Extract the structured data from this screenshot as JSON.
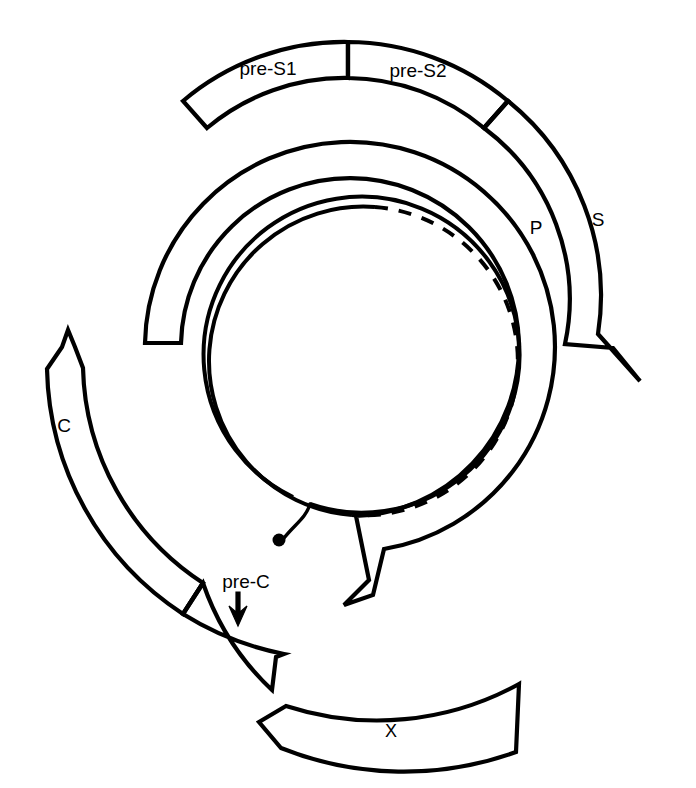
{
  "figure": {
    "background_color": "#ffffff",
    "stroke_color": "#000000",
    "width": 696,
    "height": 788
  },
  "genome": {
    "center": {
      "x": 350,
      "y": 347
    },
    "strands": {
      "outer_strand": {
        "name": "minus-strand-dna",
        "style": "solid",
        "radius": 158,
        "description": "complete circular strand with nick"
      },
      "inner_strand": {
        "name": "plus-strand-dna",
        "style": "solid-then-dashed",
        "radius": 142,
        "description": "incomplete strand, dashed where missing"
      },
      "protein_label": "terminal-protein-dot"
    }
  },
  "orfs": [
    {
      "id": "pre-s1",
      "label": "pre-S1",
      "label_x": 268,
      "label_y": 70,
      "radius": 248,
      "band_width": 36,
      "start_deg": 228,
      "end_deg": 268,
      "start_cap": "blunt",
      "end_cap": "none"
    },
    {
      "id": "pre-s2",
      "label": "pre-S2",
      "label_x": 418,
      "label_y": 72,
      "radius": 248,
      "band_width": 36,
      "start_deg": 268,
      "end_deg": 297,
      "start_cap": "none",
      "end_cap": "none"
    },
    {
      "id": "s",
      "label": "S",
      "label_x": 598,
      "label_y": 221,
      "radius": 248,
      "band_width": 36,
      "start_deg": 297,
      "end_deg": 372,
      "start_cap": "none",
      "end_cap": "arrow"
    },
    {
      "id": "p",
      "label": "P",
      "label_x": 536,
      "label_y": 229,
      "radius": 205,
      "band_width": 36,
      "start_deg": 180,
      "end_deg": 412,
      "start_cap": "blunt",
      "end_cap": "arrow"
    },
    {
      "id": "c",
      "label": "C",
      "label_x": 64,
      "label_y": 427,
      "radius": 280,
      "band_width": 36,
      "start_deg": 122,
      "end_deg": 222,
      "start_cap": "blunt",
      "end_cap": "arrow"
    },
    {
      "id": "pre-c",
      "label": "pre-C",
      "label_x": 246,
      "label_y": 583,
      "radius": 280,
      "band_width": 36,
      "start_deg": 108,
      "end_deg": 122,
      "start_cap": "blunt",
      "end_cap": "none"
    },
    {
      "id": "x",
      "label": "X",
      "label_x": 391,
      "label_y": 732,
      "radius": 330,
      "band_width": 36,
      "start_deg": 60,
      "end_deg": 108,
      "start_cap": "none",
      "end_cap": "arrow"
    }
  ],
  "annotations": {
    "pre_c_arrow": {
      "name": "pre-c-pointer-arrow",
      "tip_x": 238,
      "tip_y": 623,
      "tail_x": 238,
      "tail_y": 593
    }
  }
}
